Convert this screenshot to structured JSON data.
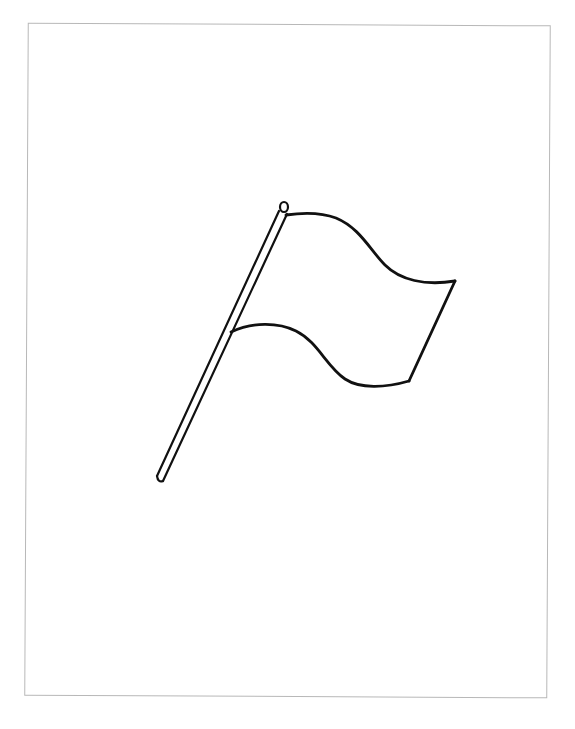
{
  "page": {
    "caption": "",
    "colors": {
      "background": "#ffffff",
      "frame": "#b8b8b8",
      "line": "#111111"
    }
  }
}
